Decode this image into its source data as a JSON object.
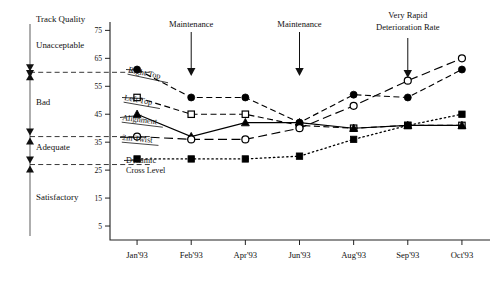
{
  "chart_data": {
    "type": "line",
    "title": "",
    "xlabel": "",
    "ylabel": "",
    "x": [
      "Jan'93",
      "Feb'93",
      "Apr'93",
      "Jun'93",
      "Aug'93",
      "Sep'93",
      "Oct'93"
    ],
    "ylim": [
      0,
      78
    ],
    "yticks": [
      5,
      15,
      25,
      35,
      45,
      55,
      65,
      75
    ],
    "grid": false,
    "legend_position": "inline-left",
    "series": [
      {
        "name": "Right Top",
        "marker": "filled-circle",
        "linestyle": "dashed",
        "values": [
          61,
          51,
          51,
          42,
          52,
          51,
          61
        ]
      },
      {
        "name": "Left Top",
        "marker": "open-square",
        "linestyle": "dashed",
        "values": [
          51,
          45,
          45,
          41,
          40,
          41,
          41
        ]
      },
      {
        "name": "Alignment",
        "marker": "filled-triangle",
        "linestyle": "solid",
        "values": [
          45,
          37,
          42,
          42,
          40,
          41,
          41
        ]
      },
      {
        "name": "2m Twist",
        "marker": "open-circle",
        "linestyle": "long-dash",
        "values": [
          37,
          36,
          36,
          40,
          48,
          57,
          65
        ]
      },
      {
        "name": "Dynamic Cross Level",
        "marker": "filled-square",
        "linestyle": "dotted",
        "values": [
          29,
          29,
          29,
          30,
          36,
          41,
          45
        ]
      }
    ],
    "annotations": [
      {
        "label": "Maintenance",
        "at_x": "Feb'93",
        "kind": "arrow-down"
      },
      {
        "label": "Maintenance",
        "at_x": "Jun'93",
        "kind": "arrow-down"
      },
      {
        "label": "Very Rapid Deterioration Rate",
        "at_x": "Sep'93",
        "kind": "arrow-down"
      }
    ],
    "quality_scale": {
      "title": "Track Quality",
      "bands": [
        {
          "label": "Unacceptable",
          "upper": 75,
          "lower": 60
        },
        {
          "label": "Bad",
          "upper": 60,
          "lower": 37
        },
        {
          "label": "Adequate",
          "upper": 37,
          "lower": 27
        },
        {
          "label": "Satisfactory",
          "upper": 27,
          "lower": 0
        }
      ],
      "thresholds": [
        60,
        37,
        27
      ]
    },
    "colors": {
      "ink": "#000000",
      "axis": "#222222",
      "background": "#ffffff",
      "bracket": "#777777"
    }
  }
}
